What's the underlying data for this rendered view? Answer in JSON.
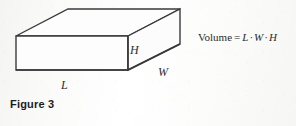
{
  "figure": {
    "caption": "Figure 3",
    "shape_name": "rectangular-box",
    "background_color": "#fbfbfa",
    "line_color": "#3a3a3a",
    "face_fill": "#fdfdfd",
    "labels": {
      "height": "H",
      "length": "L",
      "width": "W"
    },
    "formula": {
      "lhs": "Volume",
      "equals": "=",
      "term1": "L",
      "operator1": "·",
      "term2": "W",
      "operator2": "·",
      "term3": "H",
      "full_text": "Volume = L · W · H"
    }
  }
}
